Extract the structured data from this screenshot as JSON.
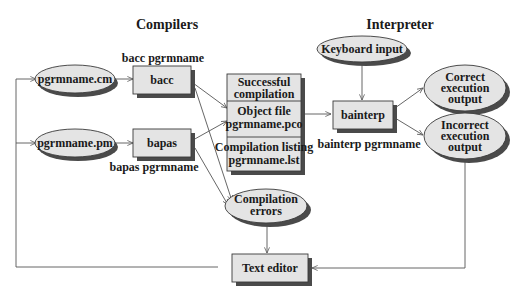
{
  "diagram": {
    "headings": {
      "compilers": "Compilers",
      "interpreter": "Interpreter"
    },
    "nodes": {
      "pgrm_cm": {
        "label": "pgrmname.cm",
        "shape": "ellipse"
      },
      "pgrm_pm": {
        "label": "pgrmname.pm",
        "shape": "ellipse"
      },
      "bacc": {
        "label": "bacc",
        "shape": "box"
      },
      "bapas": {
        "label": "bapas",
        "shape": "box"
      },
      "successful": {
        "line1": "Successful",
        "line2": "compilation",
        "shape": "box"
      },
      "object_file": {
        "line1": "Object file",
        "line2": "pgrmname.pco",
        "shape": "box"
      },
      "listing": {
        "line1": "Compilation listing",
        "line2": "pgrmname.lst",
        "shape": "box"
      },
      "compilation_errors": {
        "line1": "Compilation",
        "line2": "errors",
        "shape": "ellipse"
      },
      "keyboard_input": {
        "label": "Keyboard input",
        "shape": "ellipse"
      },
      "bainterp": {
        "label": "bainterp",
        "shape": "box"
      },
      "correct_output": {
        "line1": "Correct",
        "line2": "execution",
        "line3": "output",
        "shape": "ellipse"
      },
      "incorrect_output": {
        "line1": "Incorrect",
        "line2": "execution",
        "line3": "output",
        "shape": "ellipse"
      },
      "text_editor": {
        "label": "Text editor",
        "shape": "box"
      }
    },
    "captions": {
      "bacc_cmd": "bacc pgrmname",
      "bapas_cmd": "bapas pgrmname",
      "bainterp_cmd": "bainterp pgrmname"
    },
    "edges": [
      {
        "from": "pgrm_cm",
        "to": "bacc"
      },
      {
        "from": "pgrm_pm",
        "to": "bapas"
      },
      {
        "from": "bacc",
        "to": "object_file"
      },
      {
        "from": "bacc",
        "to": "compilation_errors"
      },
      {
        "from": "bapas",
        "to": "object_file"
      },
      {
        "from": "bapas",
        "to": "compilation_errors"
      },
      {
        "from": "object_file",
        "to": "bainterp"
      },
      {
        "from": "keyboard_input",
        "to": "bainterp"
      },
      {
        "from": "bainterp",
        "to": "correct_output"
      },
      {
        "from": "bainterp",
        "to": "incorrect_output"
      },
      {
        "from": "compilation_errors",
        "to": "text_editor"
      },
      {
        "from": "incorrect_output",
        "to": "text_editor"
      },
      {
        "from": "text_editor",
        "to": "pgrm_cm"
      },
      {
        "from": "text_editor",
        "to": "pgrm_pm"
      }
    ],
    "colors": {
      "node_fill": "#e4e4e4",
      "shadow": "#4a4a4a",
      "edge": "#555555"
    }
  }
}
